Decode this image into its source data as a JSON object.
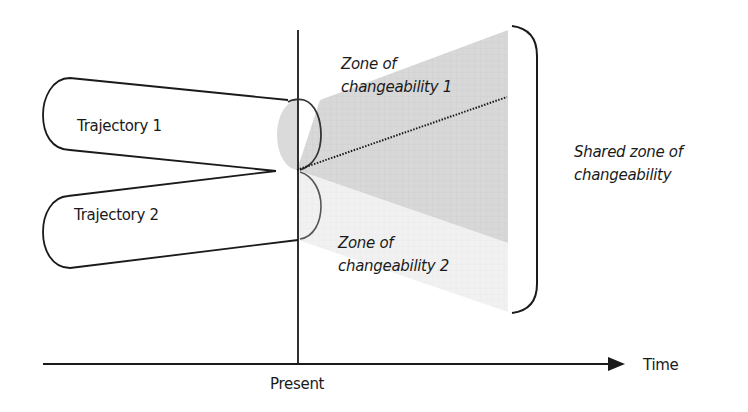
{
  "diagram": {
    "type": "conceptual-timeline",
    "labels": {
      "trajectory_1": "Trajectory 1",
      "trajectory_2": "Trajectory 2",
      "zone_1_line1": "Zone of",
      "zone_1_line2": "changeability 1",
      "zone_2_line1": "Zone of",
      "zone_2_line2": "changeability 2",
      "shared_line1": "Shared zone of",
      "shared_line2": "changeability",
      "present": "Present",
      "time": "Time"
    },
    "nodes": [
      {
        "id": "trajectory_1",
        "label": "Trajectory 1",
        "shape": "rounded-funnel"
      },
      {
        "id": "trajectory_2",
        "label": "Trajectory 2",
        "shape": "rounded-funnel"
      },
      {
        "id": "zone_1",
        "label": "Zone of changeability 1",
        "shape": "shaded-fan"
      },
      {
        "id": "zone_2",
        "label": "Zone of changeability 2",
        "shape": "light-shaded-fan"
      },
      {
        "id": "shared_zone",
        "label": "Shared zone of changeability",
        "shape": "right-brace"
      }
    ],
    "axes": {
      "horizontal": {
        "label": "Time",
        "arrow": true
      },
      "vertical_marker": {
        "label": "Present"
      }
    },
    "colors": {
      "stroke": "#1a1a1a",
      "zone_1_fill": "#d6d6d6",
      "zone_2_fill": "#efefef",
      "ellipse_shade": "#dcdcdc"
    }
  }
}
